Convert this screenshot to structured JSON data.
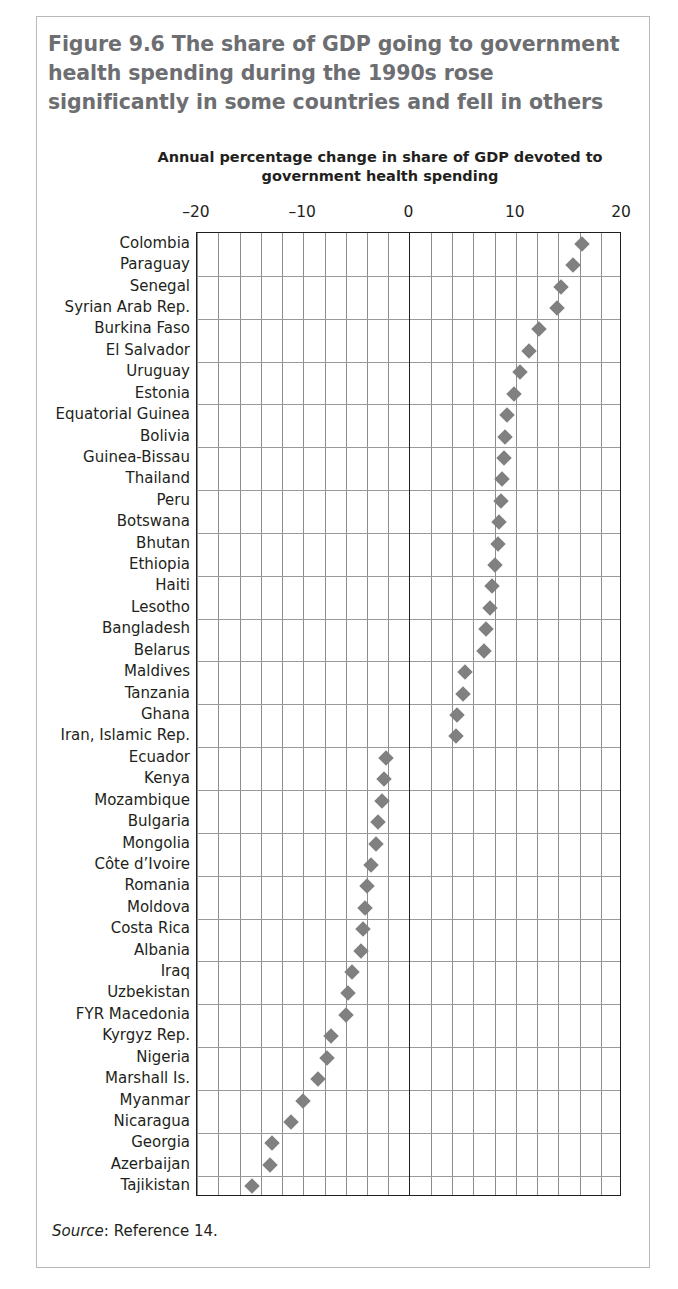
{
  "figure": {
    "title": "Figure 9.6  The share of GDP going to government health spending during the 1990s rose significantly in some countries and fell in others",
    "source_word": "Source",
    "source_rest": ": Reference 14."
  },
  "colors": {
    "marker": "#808080",
    "axis": "#231f20",
    "grid": "#8d8d8d",
    "title": "#6d6e71",
    "frame": "#b9b9b9"
  },
  "chart_data": {
    "type": "scatter",
    "orientation": "horizontal",
    "title": "Figure 9.6  The share of GDP going to government health spending during the 1990s rose significantly in some countries and fell in others",
    "xlabel": "Annual percentage change in share of GDP devoted to government health spending",
    "ylabel": "",
    "xlim": [
      -20,
      20
    ],
    "xticks": [
      -20,
      -10,
      0,
      10,
      20
    ],
    "xtick_labels": [
      "–20",
      "–10",
      "0",
      "10",
      "20"
    ],
    "grid": true,
    "grid_x_step": 2,
    "legend": "none",
    "categories": [
      "Colombia",
      "Paraguay",
      "Senegal",
      "Syrian Arab Rep.",
      "Burkina Faso",
      "El Salvador",
      "Uruguay",
      "Estonia",
      "Equatorial Guinea",
      "Bolivia",
      "Guinea-Bissau",
      "Thailand",
      "Peru",
      "Botswana",
      "Bhutan",
      "Ethiopia",
      "Haiti",
      "Lesotho",
      "Bangladesh",
      "Belarus",
      "Maldives",
      "Tanzania",
      "Ghana",
      "Iran, Islamic Rep.",
      "Ecuador",
      "Kenya",
      "Mozambique",
      "Bulgaria",
      "Mongolia",
      "Côte d’Ivoire",
      "Romania",
      "Moldova",
      "Costa Rica",
      "Albania",
      "Iraq",
      "Uzbekistan",
      "FYR Macedonia",
      "Kyrgyz Rep.",
      "Nigeria",
      "Marshall Is.",
      "Myanmar",
      "Nicaragua",
      "Georgia",
      "Azerbaijan",
      "Tajikistan"
    ],
    "values": [
      16.2,
      15.4,
      14.3,
      13.9,
      12.2,
      11.2,
      10.4,
      9.8,
      9.2,
      9.0,
      8.9,
      8.7,
      8.6,
      8.4,
      8.3,
      8.0,
      7.8,
      7.6,
      7.2,
      7.0,
      5.2,
      5.0,
      4.5,
      4.4,
      -2.2,
      -2.4,
      -2.6,
      -3.0,
      -3.2,
      -3.6,
      -4.0,
      -4.2,
      -4.4,
      -4.6,
      -5.4,
      -5.8,
      -6.0,
      -7.4,
      -7.8,
      -8.6,
      -10.0,
      -11.2,
      -12.9,
      -13.1,
      -14.8
    ]
  }
}
